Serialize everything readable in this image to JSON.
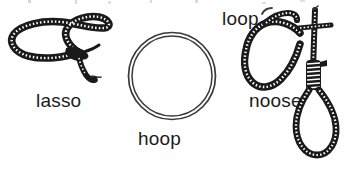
{
  "illustration": {
    "background_color": "#ffffff",
    "ink_color": "#1a1a1a",
    "rope_texture_color": "#ffffff",
    "style": "black-and-white line drawing, textbook vocabulary illustration",
    "subject": "three rope figures with captions",
    "figures": [
      {
        "id": "lasso",
        "label": "lasso",
        "icon_name": "lasso-rope-icon",
        "description": "wide flattened rope loop with a knot at lower center and a free tail hanging down to the right",
        "rope_style": "thick dark rope with white stitch dashes",
        "position": "left"
      },
      {
        "id": "hoop",
        "label": "hoop",
        "icon_name": "hoop-ring-icon",
        "description": "plain closed circle drawn as two thin concentric outlines forming a ring",
        "rope_style": "thin double outline, no texture",
        "position": "center"
      },
      {
        "id": "noose",
        "label": "noose",
        "icon_name": "noose-rope-icon",
        "description": "standing rope crossing a loop, wrapped knot, and a hanging teardrop loop below",
        "rope_style": "thick dark rope with white stitch dashes",
        "position": "right"
      }
    ],
    "callouts": [
      {
        "id": "loop",
        "label": "loop",
        "icon_name": "loop-callout-icon",
        "description": "label identifying the upper curved bight of the noose rope",
        "position": "top-right"
      }
    ]
  },
  "labels": {
    "lasso": "lasso",
    "hoop": "hoop",
    "loop": "loop",
    "noose": "noose"
  },
  "colors": {
    "background": "#ffffff",
    "ink": "#1a1a1a",
    "rope_highlight": "#ffffff",
    "thin_line": "#3a3a3a"
  }
}
